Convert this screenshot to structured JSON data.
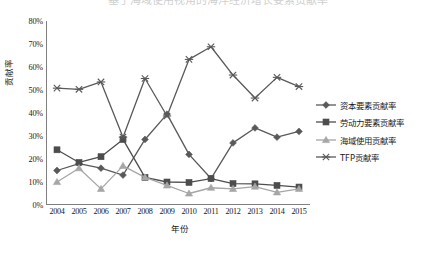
{
  "title_clipped": "基于海域使用视角的海洋经济增长要素贡献率",
  "chart_data": {
    "type": "line",
    "title": "",
    "xlabel": "年份",
    "ylabel": "贡献率",
    "categories": [
      "2004",
      "2005",
      "2006",
      "2007",
      "2008",
      "2009",
      "2010",
      "2011",
      "2012",
      "2013",
      "2014",
      "2015"
    ],
    "ylim": [
      0,
      80
    ],
    "yticks": [
      "0%",
      "10%",
      "20%",
      "30%",
      "40%",
      "50%",
      "60%",
      "70%",
      "80%"
    ],
    "ytick_values": [
      0,
      10,
      20,
      30,
      40,
      50,
      60,
      70,
      80
    ],
    "grid": false,
    "legend_position": "right",
    "series": [
      {
        "name": "资本要素贡献率",
        "marker": "diamond",
        "color": "#595959",
        "values": [
          15.0,
          18.0,
          16.0,
          13.0,
          28.5,
          39.5,
          22.0,
          11.5,
          27.0,
          33.5,
          29.5,
          32.0
        ]
      },
      {
        "name": "劳动力要素贡献率",
        "marker": "square",
        "color": "#4d4d4d",
        "values": [
          24.0,
          18.5,
          21.0,
          28.5,
          12.0,
          10.0,
          9.8,
          11.5,
          9.3,
          9.2,
          8.5,
          7.8
        ]
      },
      {
        "name": "海域使用贡献率",
        "marker": "triangle",
        "color": "#a6a6a6",
        "values": [
          10.0,
          16.0,
          7.0,
          17.0,
          12.0,
          8.5,
          5.0,
          7.5,
          7.0,
          8.0,
          5.5,
          7.0
        ]
      },
      {
        "name": "TFP贡献率",
        "marker": "cross",
        "color": "#595959",
        "values": [
          50.8,
          50.3,
          53.5,
          29.5,
          55.0,
          38.7,
          63.3,
          68.8,
          56.5,
          46.5,
          55.5,
          51.5
        ]
      }
    ]
  },
  "axis_color": "#808080"
}
